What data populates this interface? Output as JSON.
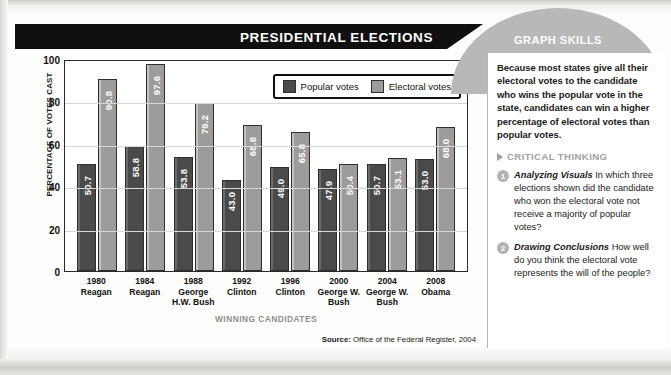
{
  "header": {
    "title": "PRESIDENTIAL ELECTIONS",
    "sidebar_title": "GRAPH SKILLS"
  },
  "sidebar": {
    "intro": "Because most states give all their electoral votes to the candidate who wins the popular vote in the state, candidates can win a higher percentage of electoral votes than popular votes.",
    "critical_thinking_label": "CRITICAL THINKING",
    "questions": [
      {
        "number": "1",
        "title": "Analyzing Visuals",
        "body": "In which three elections shown did the candidate who won the electoral vote not receive a majority of popular votes?"
      },
      {
        "number": "2",
        "title": "Drawing Conclusions",
        "body": "How well do you think the electoral vote represents the will of the people?"
      }
    ]
  },
  "chart_data": {
    "type": "bar",
    "title": "PRESIDENTIAL ELECTIONS",
    "xlabel": "WINNING CANDIDATES",
    "ylabel": "PERCENTAGE OF VOTES CAST",
    "ylim": [
      0,
      100
    ],
    "yticks": [
      100,
      80,
      60,
      40,
      20,
      0
    ],
    "grid": true,
    "legend_position": "top-right",
    "categories": [
      {
        "year": "1980",
        "candidate": "Reagan"
      },
      {
        "year": "1984",
        "candidate": "Reagan"
      },
      {
        "year": "1988",
        "candidate": "George H.W. Bush"
      },
      {
        "year": "1992",
        "candidate": "Clinton"
      },
      {
        "year": "1996",
        "candidate": "Clinton"
      },
      {
        "year": "2000",
        "candidate": "George W. Bush"
      },
      {
        "year": "2004",
        "candidate": "George W. Bush"
      },
      {
        "year": "2008",
        "candidate": "Obama"
      }
    ],
    "series": [
      {
        "name": "Popular votes",
        "color": "#4a4a4a",
        "values": [
          50.7,
          58.8,
          53.8,
          43.0,
          49.0,
          47.9,
          50.7,
          53.0
        ],
        "labels": [
          "50.7",
          "58.8",
          "53.8",
          "43.0",
          "49.0",
          "47.9",
          "50.7",
          "53.0"
        ]
      },
      {
        "name": "Electoral votes",
        "color": "#9d9c9a",
        "values": [
          90.8,
          97.6,
          79.2,
          68.8,
          65.8,
          50.4,
          53.1,
          68.0
        ],
        "labels": [
          "90.8",
          "97.6",
          "79.2",
          "68.8",
          "65.8",
          "50.4",
          "53.1",
          "68.0"
        ]
      }
    ],
    "source": {
      "label": "Source:",
      "text": " Office of the Federal Register, 2004"
    }
  }
}
